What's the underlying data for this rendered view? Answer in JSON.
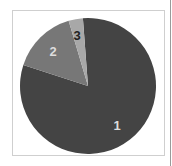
{
  "chart_data": {
    "type": "pie",
    "title": "",
    "categories": [
      "1",
      "2",
      "3"
    ],
    "values": [
      81.2,
      15.4,
      3.4
    ],
    "start_angle_deg": 355.7,
    "direction": "clockwise",
    "colors": [
      "#444444",
      "#777777",
      "#a8a8a8"
    ],
    "label_colors": [
      "#dddddd",
      "#dddddd",
      "#222222"
    ],
    "labels": [
      "1",
      "2",
      "3"
    ],
    "legend": "none"
  },
  "layout": {
    "center": [
      88,
      86
    ],
    "radius": 68,
    "label_positions": [
      [
        117,
        130
      ],
      [
        53,
        56
      ],
      [
        77,
        40
      ]
    ]
  }
}
